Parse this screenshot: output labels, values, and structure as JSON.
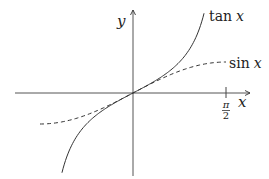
{
  "chart_data": {
    "type": "line",
    "title": "",
    "xlabel": "x",
    "ylabel": "y",
    "x_tick_labels": [
      {
        "value": 1.5708,
        "label": "π/2"
      }
    ],
    "xlim": [
      -2.0,
      2.05
    ],
    "ylim": [
      -2.65,
      2.95
    ],
    "grid": false,
    "legend_position": "inline labels at curve ends",
    "series": [
      {
        "name": "tan x",
        "label": "tan x",
        "style": "solid",
        "x": [
          -1.2,
          -1.0,
          -0.8,
          -0.6,
          -0.4,
          -0.2,
          0,
          0.2,
          0.4,
          0.6,
          0.8,
          1.0,
          1.2
        ],
        "values": [
          -2.57,
          -1.56,
          -1.03,
          -0.68,
          -0.42,
          -0.2,
          0,
          0.2,
          0.42,
          0.68,
          1.03,
          1.56,
          2.57
        ]
      },
      {
        "name": "sin x",
        "label": "sin x",
        "style": "dashed",
        "x": [
          -1.5708,
          -1.2,
          -0.8,
          -0.4,
          0,
          0.4,
          0.8,
          1.2,
          1.5708
        ],
        "values": [
          -1.0,
          -0.93,
          -0.72,
          -0.39,
          0,
          0.39,
          0.72,
          0.93,
          1.0
        ]
      }
    ]
  },
  "labels": {
    "y_axis": "y",
    "x_axis": "x",
    "tan": {
      "fn": "tan",
      "var": "x"
    },
    "sin": {
      "fn": "sin",
      "var": "x"
    },
    "tick_num": "π",
    "tick_den": "2"
  }
}
